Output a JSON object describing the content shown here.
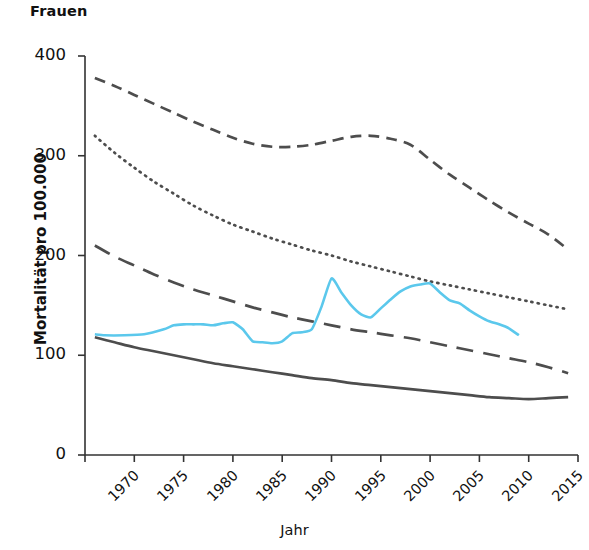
{
  "chart_data": {
    "type": "line",
    "title": "Frauen",
    "xlabel": "Jahr",
    "ylabel": "Mortalität pro 100.000",
    "xlim": [
      1970,
      2020
    ],
    "ylim": [
      0,
      400
    ],
    "xticks": [
      "1970",
      "1975",
      "1980",
      "1985",
      "1990",
      "1995",
      "2000",
      "2005",
      "2010",
      "2015",
      "2020"
    ],
    "yticks": [
      "0",
      "100",
      "200",
      "300",
      "400"
    ],
    "grid": false,
    "legend": "none",
    "colors": {
      "gray": "#4d4d4d",
      "cyan": "#5bc8ec",
      "axis": "#333333"
    },
    "series": [
      {
        "name": "dashed-upper",
        "style": "dashed",
        "color": "#4d4d4d",
        "x": [
          1971,
          1973,
          1975,
          1977,
          1979,
          1981,
          1983,
          1985,
          1987,
          1989,
          1991,
          1993,
          1995,
          1997,
          1999,
          2001,
          2003,
          2005,
          2007,
          2009,
          2011,
          2013,
          2015,
          2017,
          2019
        ],
        "values": [
          378,
          370,
          361,
          352,
          343,
          334,
          326,
          318,
          312,
          309,
          309,
          311,
          315,
          319,
          320,
          317,
          311,
          296,
          281,
          268,
          255,
          243,
          232,
          221,
          206
        ]
      },
      {
        "name": "dotted",
        "style": "dotted",
        "color": "#4d4d4d",
        "x": [
          1971,
          1973,
          1975,
          1977,
          1979,
          1981,
          1983,
          1985,
          1987,
          1989,
          1991,
          1993,
          1995,
          1997,
          1999,
          2001,
          2003,
          2005,
          2007,
          2009,
          2011,
          2013,
          2015,
          2017,
          2019
        ],
        "values": [
          320,
          303,
          288,
          274,
          262,
          250,
          240,
          231,
          224,
          217,
          211,
          205,
          200,
          194,
          189,
          184,
          179,
          174,
          170,
          166,
          162,
          158,
          154,
          150,
          146
        ]
      },
      {
        "name": "long-dashed",
        "style": "long-dashed",
        "color": "#4d4d4d",
        "x": [
          1971,
          1973,
          1975,
          1977,
          1979,
          1981,
          1983,
          1985,
          1987,
          1989,
          1991,
          1993,
          1995,
          1997,
          1999,
          2001,
          2003,
          2005,
          2007,
          2009,
          2011,
          2013,
          2015,
          2017,
          2019
        ],
        "values": [
          210,
          199,
          190,
          181,
          173,
          166,
          160,
          154,
          148,
          143,
          138,
          134,
          130,
          126,
          123,
          120,
          117,
          113,
          109,
          105,
          101,
          97,
          93,
          88,
          82
        ]
      },
      {
        "name": "solid-lower",
        "style": "solid",
        "color": "#4d4d4d",
        "x": [
          1971,
          1973,
          1975,
          1977,
          1979,
          1981,
          1983,
          1985,
          1987,
          1989,
          1991,
          1993,
          1995,
          1997,
          1999,
          2001,
          2003,
          2005,
          2007,
          2009,
          2011,
          2013,
          2015,
          2017,
          2019
        ],
        "values": [
          118,
          113,
          108,
          104,
          100,
          96,
          92,
          89,
          86,
          83,
          80,
          77,
          75,
          72,
          70,
          68,
          66,
          64,
          62,
          60,
          58,
          57,
          56,
          57,
          58
        ]
      },
      {
        "name": "cyan-highlight",
        "style": "solid",
        "color": "#5bc8ec",
        "x": [
          1971,
          1972,
          1974,
          1976,
          1978,
          1979,
          1980,
          1981,
          1982,
          1983,
          1984,
          1985,
          1986,
          1987,
          1988,
          1989,
          1990,
          1991,
          1992,
          1993,
          1994,
          1995,
          1996,
          1997,
          1998,
          1999,
          2000,
          2001,
          2002,
          2003,
          2004,
          2005,
          2006,
          2007,
          2008,
          2009,
          2010,
          2011,
          2012,
          2013,
          2014
        ],
        "values": [
          121,
          120,
          120,
          121,
          126,
          130,
          131,
          131,
          131,
          130,
          132,
          133,
          126,
          114,
          113,
          112,
          114,
          122,
          123,
          126,
          149,
          177,
          163,
          150,
          141,
          138,
          147,
          156,
          164,
          169,
          171,
          172,
          163,
          155,
          152,
          145,
          139,
          134,
          131,
          127,
          120
        ]
      }
    ]
  }
}
